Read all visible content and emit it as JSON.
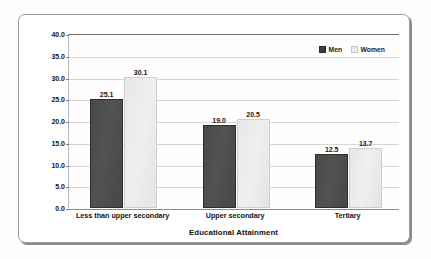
{
  "chart_data": {
    "type": "bar",
    "title": "",
    "subtitle": "",
    "xlabel": "Educational Attainment",
    "ylabel": "Proportion of people with disabilities",
    "categories": [
      "Less than upper secondary",
      "Upper secondary",
      "Tertiary"
    ],
    "series": [
      {
        "name": "Men",
        "values": [
          25.1,
          19.0,
          12.5
        ],
        "color": "#494949"
      },
      {
        "name": "Women",
        "values": [
          30.1,
          20.5,
          13.7
        ],
        "color": "#e9e9e9"
      }
    ],
    "value_labels": {
      "men": [
        "25.1",
        "19.0",
        "12.5"
      ],
      "women": [
        "30.1",
        "20.5",
        "13.7"
      ]
    },
    "ylim": [
      0.0,
      40.0
    ],
    "ytick_step": 5.0,
    "ytick_labels": [
      "0.0",
      "5.0",
      "10.0",
      "15.0",
      "20.0",
      "25.0",
      "30.0",
      "35.0",
      "40.0"
    ],
    "grid": true,
    "legend_position": "top-right-inside",
    "legend_entries": [
      "Men",
      "Women"
    ],
    "orientation": "vertical",
    "grouped": true
  },
  "colors": {
    "men_bar": "#494949",
    "women_bar": "#e9e9e9",
    "gridline": "#d6d6d6",
    "axis": "#6e6e6e",
    "frame": "#9a9a9a",
    "text": "#141414",
    "background": "#ffffff"
  }
}
